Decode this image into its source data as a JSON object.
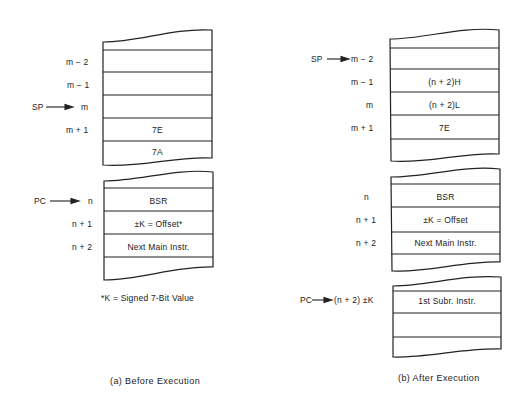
{
  "panel_a": {
    "caption": "(a) Before Execution",
    "footnote": "*K = Signed 7-Bit Value",
    "stack": {
      "pointer": "SP",
      "rows": [
        {
          "addr": "m − 2",
          "value": ""
        },
        {
          "addr": "m − 1",
          "value": ""
        },
        {
          "addr": "m",
          "value": ""
        },
        {
          "addr": "m + 1",
          "value": "7E"
        },
        {
          "addr": "",
          "value": "7A"
        }
      ]
    },
    "program": {
      "pointer": "PC",
      "rows": [
        {
          "addr": "n",
          "value": "BSR"
        },
        {
          "addr": "n + 1",
          "value": "±K = Offset*"
        },
        {
          "addr": "n + 2",
          "value": "Next Main Instr."
        }
      ]
    }
  },
  "panel_b": {
    "caption": "(b) After Execution",
    "stack": {
      "pointer": "SP",
      "rows": [
        {
          "addr": "m − 2",
          "value": ""
        },
        {
          "addr": "m − 1",
          "value": "(n + 2)H"
        },
        {
          "addr": "m",
          "value": "(n + 2)L"
        },
        {
          "addr": "m + 1",
          "value": "7E"
        }
      ]
    },
    "program": {
      "rows": [
        {
          "addr": "n",
          "value": "BSR"
        },
        {
          "addr": "n + 1",
          "value": "±K = Offset"
        },
        {
          "addr": "n + 2",
          "value": "Next Main Instr."
        }
      ]
    },
    "subroutine": {
      "pointer": "PC",
      "rows": [
        {
          "addr": "(n + 2) ±K",
          "value": "1st Subr. Instr."
        }
      ]
    }
  }
}
